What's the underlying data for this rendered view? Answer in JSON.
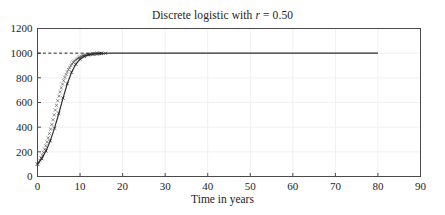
{
  "chart_data": {
    "type": "line",
    "title": "Discrete logistic with r = 0.50",
    "title_prefix": "Discrete logistic with ",
    "title_symbol": "r",
    "title_suffix": " = 0.50",
    "xlabel": "Time in years",
    "ylabel": "",
    "xlim": [
      0,
      90
    ],
    "ylim": [
      0,
      1200
    ],
    "xticks": [
      0,
      10,
      20,
      30,
      40,
      50,
      60,
      70,
      80,
      90
    ],
    "yticks": [
      0,
      200,
      400,
      600,
      800,
      1000,
      1200
    ],
    "xtick_labels": [
      "0",
      "10",
      "20",
      "30",
      "40",
      "50",
      "60",
      "70",
      "80",
      "90"
    ],
    "ytick_labels": [
      "0",
      "200",
      "400",
      "600",
      "800",
      "1000",
      "1200"
    ],
    "grid": true,
    "legend": "none",
    "growth_rate": 0.5,
    "carrying_capacity": 1000,
    "initial_population": 100,
    "marker": "x",
    "line_color": "#2b2b2b",
    "grid_color": "#f0f0f0",
    "axis_color": "#4a4a4a",
    "series": [
      {
        "name": "Population",
        "x": [
          0,
          1,
          2,
          3,
          4,
          5,
          6,
          7,
          8,
          9,
          10,
          11,
          12,
          13,
          14,
          15,
          16,
          17,
          18,
          19,
          20,
          21,
          22,
          23,
          24,
          25,
          26,
          27,
          28,
          29,
          30,
          31,
          32,
          33,
          34,
          35,
          36,
          37,
          38,
          39,
          40,
          41,
          42,
          43,
          44,
          45,
          46,
          47,
          48,
          49,
          50,
          51,
          52,
          53,
          54,
          55,
          56,
          57,
          58,
          59,
          60,
          61,
          62,
          63,
          64,
          65,
          66,
          67,
          68,
          69,
          70,
          71,
          72,
          73,
          74,
          75,
          76,
          77,
          78,
          79,
          80
        ],
        "values": [
          100,
          145,
          207,
          289,
          392,
          511,
          636,
          752,
          845,
          910,
          951,
          974,
          987,
          993,
          997,
          998,
          999,
          1000,
          1000,
          1000,
          1000,
          1000,
          1000,
          1000,
          1000,
          1000,
          1000,
          1000,
          1000,
          1000,
          1000,
          1000,
          1000,
          1000,
          1000,
          1000,
          1000,
          1000,
          1000,
          1000,
          1000,
          1000,
          1000,
          1000,
          1000,
          1000,
          1000,
          1000,
          1000,
          1000,
          1000,
          1000,
          1000,
          1000,
          1000,
          1000,
          1000,
          1000,
          1000,
          1000,
          1000,
          1000,
          1000,
          1000,
          1000,
          1000,
          1000,
          1000,
          1000,
          1000,
          1000,
          1000,
          1000,
          1000,
          1000,
          1000,
          1000,
          1000,
          1000,
          1000,
          1000
        ]
      }
    ],
    "reference_lines": [
      {
        "name": "carrying-capacity",
        "orientation": "horizontal",
        "value": 1000,
        "style": "dashed",
        "x_start": 0,
        "x_end": 13
      }
    ]
  }
}
